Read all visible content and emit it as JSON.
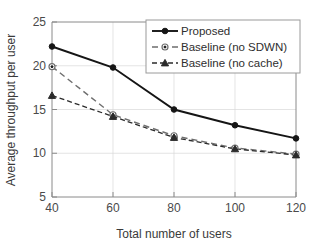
{
  "chart_data": {
    "type": "line",
    "title": "",
    "xlabel": "Total number of users",
    "ylabel": "Average throughput per user",
    "x": [
      40,
      60,
      80,
      100,
      120
    ],
    "xticklabels": [
      "40",
      "60",
      "80",
      "100",
      "120"
    ],
    "yticklabels": [
      "5",
      "10",
      "15",
      "20",
      "25"
    ],
    "yticks": [
      5,
      10,
      15,
      20,
      25
    ],
    "xlim": [
      40,
      120
    ],
    "ylim": [
      5,
      25
    ],
    "grid": true,
    "legend_position": "upper right",
    "series": [
      {
        "name": "Proposed",
        "values": [
          22.2,
          19.8,
          15.0,
          13.2,
          11.7
        ],
        "linestyle": "solid",
        "marker": "filled-circle",
        "color": "#151515"
      },
      {
        "name": "Baseline (no SDWN)",
        "values": [
          19.9,
          14.4,
          12.0,
          10.6,
          9.9
        ],
        "linestyle": "dashed",
        "marker": "open-circle",
        "color": "#6e6e6e"
      },
      {
        "name": "Baseline (no cache)",
        "values": [
          16.6,
          14.2,
          11.8,
          10.5,
          9.8
        ],
        "linestyle": "dashed",
        "marker": "filled-triangle",
        "color": "#2b2b2b"
      }
    ]
  }
}
